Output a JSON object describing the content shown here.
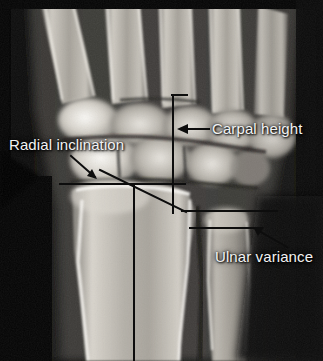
{
  "figure": {
    "type": "radiograph",
    "modality": "X-ray",
    "view": "posteroanterior-wrist",
    "width": 323,
    "height": 361,
    "background_color": "#000000",
    "label_color": "#f2f2f2",
    "line_color": "#0d0d0d"
  },
  "annotations": [
    {
      "id": "radial-inclination",
      "label": "Radial inclination",
      "label_x": 9,
      "label_y": 137,
      "arrow": {
        "x1": 71,
        "y1": 156,
        "x2": 97,
        "y2": 179
      },
      "lines": [
        {
          "kind": "horizontal-reference",
          "x1": 60,
          "y1": 184,
          "x2": 185,
          "y2": 184
        },
        {
          "kind": "radial-tilt",
          "x1": 100,
          "y1": 170,
          "x2": 186,
          "y2": 212
        },
        {
          "kind": "long-axis",
          "x1": 134,
          "y1": 184,
          "x2": 134,
          "y2": 361
        }
      ]
    },
    {
      "id": "carpal-height",
      "label": "Carpal height",
      "label_x": 212,
      "label_y": 121,
      "arrow": {
        "x1": 209,
        "y1": 129,
        "x2": 180,
        "y2": 129
      },
      "lines": [
        {
          "kind": "bracket-top",
          "x1": 172,
          "y1": 95,
          "x2": 186,
          "y2": 95
        },
        {
          "kind": "bracket-vertical",
          "x1": 173,
          "y1": 95,
          "x2": 173,
          "y2": 213
        }
      ]
    },
    {
      "id": "ulnar-variance",
      "label": "Ulnar variance",
      "label_x": 215,
      "label_y": 249,
      "arrow": {
        "x1": 287,
        "y1": 247,
        "x2": 256,
        "y2": 229
      },
      "lines": [
        {
          "kind": "radius-reference",
          "x1": 182,
          "y1": 211,
          "x2": 277,
          "y2": 211
        },
        {
          "kind": "ulna-reference",
          "x1": 190,
          "y1": 228,
          "x2": 256,
          "y2": 228
        }
      ]
    }
  ],
  "anatomy": {
    "structures": [
      "metacarpals",
      "carpal-bones",
      "scaphoid",
      "lunate",
      "distal-radius",
      "distal-ulna",
      "radiocarpal-joint"
    ]
  }
}
